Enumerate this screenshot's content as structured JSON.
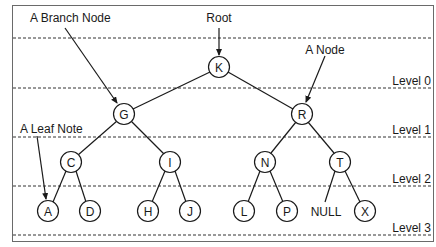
{
  "diagram": {
    "annotations": {
      "root": "Root",
      "branch_node": "A Branch Node",
      "a_node": "A Node",
      "leaf_node": "A Leaf Note"
    },
    "levels": [
      "Level 0",
      "Level 1",
      "Level 2",
      "Level 3"
    ],
    "null_label": "NULL",
    "nodes": [
      {
        "id": "K",
        "label": "K",
        "level": 0,
        "x": 219,
        "y": 67
      },
      {
        "id": "G",
        "label": "G",
        "level": 1,
        "x": 124,
        "y": 114
      },
      {
        "id": "R",
        "label": "R",
        "level": 1,
        "x": 302,
        "y": 114
      },
      {
        "id": "C",
        "label": "C",
        "level": 2,
        "x": 71,
        "y": 162
      },
      {
        "id": "I",
        "label": "I",
        "level": 2,
        "x": 170,
        "y": 162
      },
      {
        "id": "N",
        "label": "N",
        "level": 2,
        "x": 265,
        "y": 162
      },
      {
        "id": "T",
        "label": "T",
        "level": 2,
        "x": 340,
        "y": 162
      },
      {
        "id": "A",
        "label": "A",
        "level": 3,
        "x": 48,
        "y": 211
      },
      {
        "id": "D",
        "label": "D",
        "level": 3,
        "x": 90,
        "y": 211
      },
      {
        "id": "H",
        "label": "H",
        "level": 3,
        "x": 148,
        "y": 211
      },
      {
        "id": "J",
        "label": "J",
        "level": 3,
        "x": 190,
        "y": 211
      },
      {
        "id": "L",
        "label": "L",
        "level": 3,
        "x": 244,
        "y": 211
      },
      {
        "id": "P",
        "label": "P",
        "level": 3,
        "x": 287,
        "y": 211
      },
      {
        "id": "X",
        "label": "X",
        "level": 3,
        "x": 365,
        "y": 211
      }
    ],
    "edges": [
      [
        "K",
        "G"
      ],
      [
        "K",
        "R"
      ],
      [
        "G",
        "C"
      ],
      [
        "G",
        "I"
      ],
      [
        "R",
        "N"
      ],
      [
        "R",
        "T"
      ],
      [
        "C",
        "A"
      ],
      [
        "C",
        "D"
      ],
      [
        "I",
        "H"
      ],
      [
        "I",
        "J"
      ],
      [
        "N",
        "L"
      ],
      [
        "N",
        "P"
      ],
      [
        "T",
        "NULL"
      ],
      [
        "T",
        "X"
      ]
    ]
  }
}
